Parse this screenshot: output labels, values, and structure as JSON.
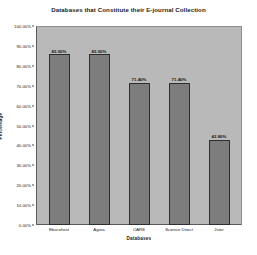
{
  "chart_data": {
    "type": "bar",
    "title": "Databases that Constitute their E-journal Collection",
    "xlabel": "Databases",
    "ylabel": "Percentage",
    "categories": [
      "Ebscohost",
      "Agora",
      "OARE",
      "Science Direct",
      "Jstor"
    ],
    "values": [
      85.9,
      85.9,
      71.4,
      71.4,
      42.8
    ],
    "data_labels": [
      "85.90%",
      "85.90%",
      "71.40%",
      "71.40%",
      "42.80%"
    ],
    "ylim": [
      0,
      100
    ],
    "ytick_labels": [
      "0.00%",
      "10.00%",
      "20.00%",
      "30.00%",
      "40.00%",
      "50.00%",
      "60.00%",
      "70.00%",
      "80.00%",
      "90.00%",
      "100.00%"
    ],
    "ytick_values": [
      0,
      10,
      20,
      30,
      40,
      50,
      60,
      70,
      80,
      90,
      100
    ],
    "grid": false,
    "legend": "none",
    "colors": {
      "bar_fill": "#7d7d7d",
      "bar_border": "#2e2e2e",
      "plot_background": "#b9b9b9",
      "figure_background": "#ffffff",
      "text": "#181818"
    }
  }
}
